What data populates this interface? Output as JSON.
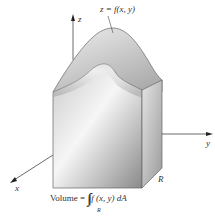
{
  "figure": {
    "surface_label": "z = f(x, y)",
    "axes": {
      "x": "x",
      "y": "y",
      "z": "z"
    },
    "region_label": "R",
    "caption": {
      "prefix": "Volume = ",
      "integral": "∫∫",
      "subscript": "R",
      "integrand": "f (x, y) dA"
    },
    "colors": {
      "axis": "#333333",
      "outline": "#555555",
      "front_light": "#f4f4f4",
      "front_dark": "#8e8e8e",
      "side": "#b0b0b0",
      "top": "#d4d4d4"
    }
  }
}
